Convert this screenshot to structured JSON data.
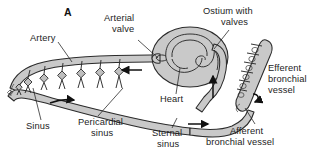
{
  "figure": {
    "panel_label": "A",
    "caption_present": false,
    "background_color": "#ffffff",
    "vessel_fill_color": "#c9c9c9",
    "vessel_stroke_color": "#2b2b2b",
    "label_text_color": "#1d1d1d"
  },
  "labels": {
    "artery": "Artery",
    "arterial_valve_line1": "Arterial",
    "arterial_valve_line2": "valve",
    "ostium_line1": "Ostium with",
    "ostium_line2": "valves",
    "heart": "Heart",
    "sinus": "Sinus",
    "pericardial_line1": "Pericardial",
    "pericardial_line2": "sinus",
    "sternal_line1": "Sternal",
    "sternal_line2": "sinus",
    "efferent_line1": "Efferent",
    "efferent_line2": "bronchial",
    "efferent_line3": "vessel",
    "afferent_line1": "Afferent",
    "afferent_line2": "bronchial vessel"
  },
  "flow_arrows": [
    {
      "name": "artery-flow-arrow",
      "direction": "left",
      "region": "artery"
    },
    {
      "name": "pericardial-sinus-flow-arrow",
      "direction": "right",
      "region": "pericardial-sinus"
    },
    {
      "name": "efferent-flow-arrow",
      "direction": "up",
      "region": "efferent-channel"
    },
    {
      "name": "sternal-sinus-flow-arrow",
      "direction": "right",
      "region": "sternal-sinus"
    },
    {
      "name": "bronchial-flow-arrow",
      "direction": "curved",
      "region": "bronchial-vessel"
    }
  ]
}
